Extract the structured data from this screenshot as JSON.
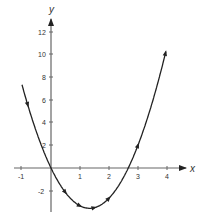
{
  "chart_data": {
    "type": "line",
    "title": "",
    "xlabel": "x",
    "ylabel": "y",
    "xlim": [
      -1,
      4.5
    ],
    "ylim": [
      -3.5,
      13
    ],
    "grid": false,
    "x_ticks": [
      -1,
      1,
      2,
      3,
      4
    ],
    "x_tick_labels": [
      "-1",
      "1",
      "2",
      "3",
      "4"
    ],
    "y_ticks": [
      -2,
      2,
      4,
      6,
      8,
      10,
      12
    ],
    "y_tick_labels": [
      "-2",
      "2",
      "4",
      "6",
      "8",
      "10",
      "12"
    ],
    "series": [
      {
        "name": "parabola",
        "function": "y = 2x^2 - 5.33x (approx.)",
        "x": [
          -1,
          -0.5,
          0,
          0.5,
          1,
          1.33,
          1.5,
          2,
          2.5,
          2.67,
          3,
          3.5,
          4
        ],
        "y": [
          7.3,
          3.2,
          0,
          -2.2,
          -3.3,
          -3.55,
          -3.5,
          -2.7,
          -0.8,
          0,
          2,
          5.8,
          10.7
        ],
        "color": "#222222",
        "arrow_markers_at_x": [
          -0.8,
          0.5,
          1.0,
          1.5,
          2.0,
          3.0,
          3.95
        ]
      }
    ],
    "legend": null
  },
  "axes": {
    "x_label": "x",
    "y_label": "y",
    "color": "#555555"
  }
}
